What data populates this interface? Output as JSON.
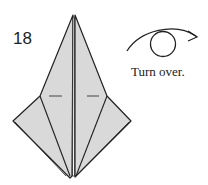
{
  "diagram": {
    "step_number": "18",
    "instruction": "Turn over.",
    "symbol": "turn-over-arrow",
    "colors": {
      "paper_fill": "#d9d9d9",
      "line": "#222222",
      "background": "#ffffff"
    }
  }
}
